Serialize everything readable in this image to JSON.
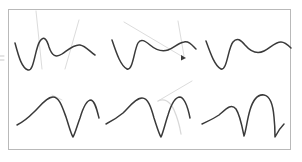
{
  "figure": {
    "title": "",
    "background_color": "#ffffff",
    "frame": {
      "x": 8,
      "y": 9,
      "width": 283,
      "height": 141,
      "border_color": "#b9b9b9",
      "border_width": 1
    },
    "stroke_colors": {
      "curve": "#3a3a3a",
      "ghost_curve": "#d8d8d8",
      "annotation": "#dcdcdc",
      "tick": "#c9c9c9"
    },
    "grid": {
      "rows": 2,
      "columns": 3,
      "row_labels": [
        "top-row-wave-curves",
        "bottom-row-arch-curves"
      ]
    },
    "panels": [
      {
        "id": "panel-top-left",
        "row": 0,
        "column": 0,
        "curve_name": "wave-dip-hump",
        "path": "M 15 43 C 19 58 22 68 28 70 C 34 72 35 48 40 41 C 44 35 47 40 49 47 C 52 56 56 58 62 54 C 68 50 74 44 80 45 C 86 46 90 52 95 55",
        "annotations": [
          {
            "name": "diagonal-annotation-1",
            "type": "line",
            "x1": 36,
            "y1": 11,
            "x2": 42,
            "y2": 69
          },
          {
            "name": "diagonal-annotation-2",
            "type": "line",
            "x1": 79,
            "y1": 20,
            "x2": 65,
            "y2": 69
          }
        ]
      },
      {
        "id": "panel-top-center",
        "row": 0,
        "column": 1,
        "curve_name": "wave-deep-dip-double-hump",
        "path": "M 112 40 C 117 55 121 66 127 69 C 133 71 134 50 138 43 C 141 38 145 41 150 45 C 156 50 162 52 168 50 C 174 48 178 43 184 42 C 189 41 192 45 196 49",
        "annotations": [
          {
            "name": "diagonal-annotation-3",
            "type": "line",
            "x1": 124,
            "y1": 22,
            "x2": 183,
            "y2": 57
          },
          {
            "name": "diagonal-annotation-4",
            "type": "line",
            "x1": 178,
            "y1": 21,
            "x2": 184,
            "y2": 56
          },
          {
            "name": "arrow-head-marker",
            "type": "dot",
            "cx": 183,
            "cy": 58,
            "r": 2
          }
        ]
      },
      {
        "id": "panel-top-right",
        "row": 0,
        "column": 2,
        "curve_name": "wave-dip-broad-hump",
        "path": "M 206 41 C 211 55 215 66 221 69 C 227 71 228 48 233 42 C 237 37 241 40 245 45 C 251 52 258 54 264 51 C 270 48 275 42 281 42 C 285 42 288 45 291 48",
        "annotations": []
      },
      {
        "id": "panel-bottom-left",
        "row": 1,
        "column": 0,
        "curve_name": "arch-valley-arch-valley",
        "path": "M 17 125 C 23 122 28 118 34 112 C 41 105 47 97 53 97 C 59 97 62 106 66 117 C 69 126 71 134 73 137 C 75 134 77 126 80 118 C 83 108 87 100 91 100 C 95 101 97 110 99 118",
        "annotations": [
          {
            "name": "peak-annotation-1",
            "type": "line",
            "x1": 52,
            "y1": 95,
            "x2": 62,
            "y2": 100
          }
        ]
      },
      {
        "id": "panel-bottom-center",
        "row": 1,
        "column": 1,
        "curve_name": "arch-valley-tall-arch",
        "path": "M 106 124 C 112 121 117 118 123 113 C 130 106 136 98 142 98 C 148 98 151 107 154 118 C 157 127 159 134 161 137 C 163 133 165 124 168 115 C 171 105 175 97 180 97 C 185 98 188 108 190 118",
        "annotations": [
          {
            "name": "diagonal-annotation-5",
            "type": "line",
            "x1": 192,
            "y1": 81,
            "x2": 158,
            "y2": 101
          },
          {
            "name": "ghost-arch-curve",
            "type": "ghost",
            "path": "M 158 101 C 164 98 170 101 174 110 C 178 119 180 128 181 134"
          }
        ]
      },
      {
        "id": "panel-bottom-right",
        "row": 1,
        "column": 2,
        "curve_name": "arch-valley-tall-arch-right",
        "path": "M 202 124 C 208 121 213 119 219 115 C 226 109 231 103 236 109 C 240 115 242 126 244 136 C 246 131 247 120 250 110 C 253 100 258 94 264 95 C 270 96 273 105 274 117 C 275 126 275 133 275 137 C 277 133 280 128 284 124",
        "annotations": []
      }
    ],
    "edge_marks": [
      {
        "name": "left-edge-tick-upper",
        "type": "line",
        "x1": 0,
        "y1": 56,
        "x2": 4,
        "y2": 56
      },
      {
        "name": "left-edge-tick-lower",
        "type": "line",
        "x1": 0,
        "y1": 60,
        "x2": 4,
        "y2": 60
      }
    ]
  }
}
